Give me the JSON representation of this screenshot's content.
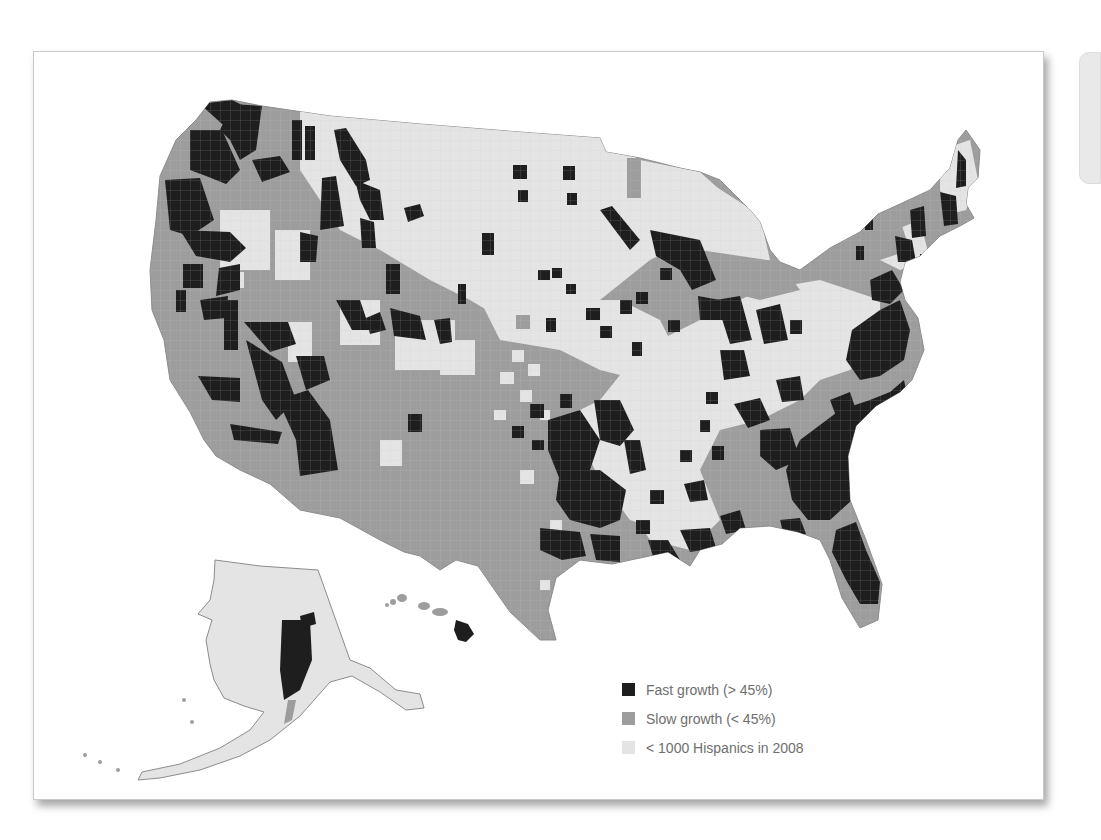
{
  "map": {
    "subject": "Hispanic population growth by U.S. county",
    "regions_shown": [
      "Contiguous United States",
      "Alaska",
      "Hawaii"
    ],
    "colors": {
      "fast": "#1e1e1e",
      "slow": "#9d9d9d",
      "few": "#e4e4e4",
      "border": "#bdbdbd"
    }
  },
  "legend": {
    "items": [
      {
        "label": "Fast growth (> 45%)",
        "color": "#1e1e1e"
      },
      {
        "label": "Slow growth (< 45%)",
        "color": "#9d9d9d"
      },
      {
        "label": "< 1000 Hispanics in 2008",
        "color": "#e4e4e4"
      }
    ]
  }
}
